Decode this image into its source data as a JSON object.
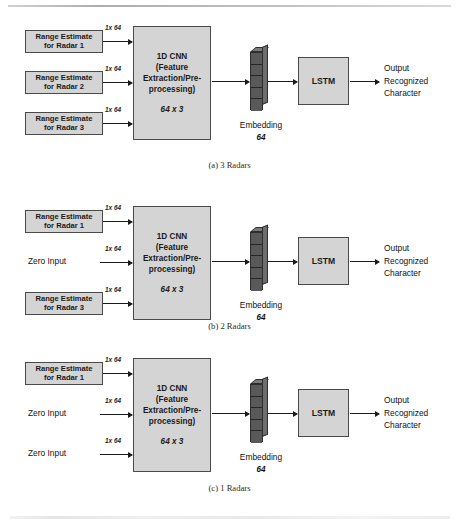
{
  "figure": {
    "panels": [
      {
        "id": "a",
        "caption": "(a) 3 Radars",
        "inputs": [
          {
            "kind": "box",
            "line1": "Range Estimate",
            "line2": "for Radar 1",
            "dim": "1x 64"
          },
          {
            "kind": "box",
            "line1": "Range Estimate",
            "line2": "for Radar 2",
            "dim": "1x 64"
          },
          {
            "kind": "box",
            "line1": "Range Estimate",
            "line2": "for Radar 3",
            "dim": "1x 64"
          }
        ],
        "cnn": {
          "line1": "1D CNN",
          "line2": "(Feature",
          "line3": "Extraction/Pre-",
          "line4": "processing)",
          "shape": "64 x 3"
        },
        "embedding": {
          "label": "Embedding",
          "size": "64",
          "cells": 5
        },
        "lstm": {
          "label": "LSTM"
        },
        "output": {
          "line1": "Output",
          "line2": "Recognized",
          "line3": "Character"
        }
      },
      {
        "id": "b",
        "caption": "(b) 2 Radars",
        "inputs": [
          {
            "kind": "box",
            "line1": "Range Estimate",
            "line2": "for Radar 1",
            "dim": "1x 64"
          },
          {
            "kind": "text",
            "text": "Zero Input",
            "dim": "1x 64"
          },
          {
            "kind": "box",
            "line1": "Range Estimate",
            "line2": "for Radar 3",
            "dim": "1x 64"
          }
        ],
        "cnn": {
          "line1": "1D CNN",
          "line2": "(Feature",
          "line3": "Extraction/Pre-",
          "line4": "processing)",
          "shape": "64 x 3"
        },
        "embedding": {
          "label": "Embedding",
          "size": "64",
          "cells": 5
        },
        "lstm": {
          "label": "LSTM"
        },
        "output": {
          "line1": "Output",
          "line2": "Recognized",
          "line3": "Character"
        }
      },
      {
        "id": "c",
        "caption": "(c) 1 Radars",
        "inputs": [
          {
            "kind": "box",
            "line1": "Range Estimate",
            "line2": "for Radar 1",
            "dim": "1x 64"
          },
          {
            "kind": "text",
            "text": "Zero Input",
            "dim": "1x 64"
          },
          {
            "kind": "text",
            "text": "Zero Input",
            "dim": "1x 64"
          }
        ],
        "cnn": {
          "line1": "1D CNN",
          "line2": "(Feature",
          "line3": "Extraction/Pre-",
          "line4": "processing)",
          "shape": "64 x 3"
        },
        "embedding": {
          "label": "Embedding",
          "size": "64",
          "cells": 5
        },
        "lstm": {
          "label": "LSTM"
        },
        "output": {
          "line1": "Output",
          "line2": "Recognized",
          "line3": "Character"
        }
      }
    ],
    "colors": {
      "box_fill": "#d4d4d4",
      "box_border": "#4a4a4a",
      "embedding_fill": "#595959",
      "arrow": "#1b1b1b",
      "background": "#ffffff"
    }
  }
}
